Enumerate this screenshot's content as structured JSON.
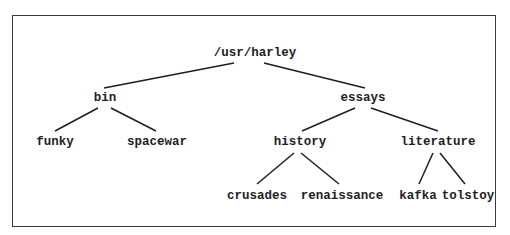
{
  "diagram": {
    "type": "directory-tree",
    "nodes": [
      {
        "id": "root",
        "label": "/usr/harley",
        "x": 255,
        "y": 53
      },
      {
        "id": "bin",
        "label": "bin",
        "x": 105,
        "y": 98
      },
      {
        "id": "essays",
        "label": "essays",
        "x": 363,
        "y": 98
      },
      {
        "id": "funky",
        "label": "funky",
        "x": 55,
        "y": 142
      },
      {
        "id": "spacewar",
        "label": "spacewar",
        "x": 157,
        "y": 142
      },
      {
        "id": "history",
        "label": "history",
        "x": 300,
        "y": 142
      },
      {
        "id": "literature",
        "label": "literature",
        "x": 438,
        "y": 142
      },
      {
        "id": "crusades",
        "label": "crusades",
        "x": 257,
        "y": 196
      },
      {
        "id": "renaissance",
        "label": "renaissance",
        "x": 342,
        "y": 196
      },
      {
        "id": "kafka",
        "label": "kafka",
        "x": 418,
        "y": 196
      },
      {
        "id": "tolstoy",
        "label": "tolstoy",
        "x": 468,
        "y": 196
      }
    ],
    "edges": [
      {
        "from": "root",
        "to": "bin",
        "x1": 234,
        "y1": 63,
        "x2": 104,
        "y2": 88
      },
      {
        "from": "root",
        "to": "essays",
        "x1": 264,
        "y1": 63,
        "x2": 365,
        "y2": 88
      },
      {
        "from": "bin",
        "to": "funky",
        "x1": 98,
        "y1": 108,
        "x2": 55,
        "y2": 131
      },
      {
        "from": "bin",
        "to": "spacewar",
        "x1": 111,
        "y1": 108,
        "x2": 156,
        "y2": 131
      },
      {
        "from": "essays",
        "to": "history",
        "x1": 355,
        "y1": 108,
        "x2": 302,
        "y2": 131
      },
      {
        "from": "essays",
        "to": "literature",
        "x1": 371,
        "y1": 108,
        "x2": 438,
        "y2": 131
      },
      {
        "from": "history",
        "to": "crusades",
        "x1": 294,
        "y1": 153,
        "x2": 257,
        "y2": 184
      },
      {
        "from": "history",
        "to": "renaissance",
        "x1": 301,
        "y1": 153,
        "x2": 339,
        "y2": 184
      },
      {
        "from": "literature",
        "to": "kafka",
        "x1": 433,
        "y1": 153,
        "x2": 419,
        "y2": 184
      },
      {
        "from": "literature",
        "to": "tolstoy",
        "x1": 440,
        "y1": 153,
        "x2": 465,
        "y2": 184
      }
    ],
    "line_color": "#1e1e1e",
    "frame_color": "#3a3a3a"
  }
}
